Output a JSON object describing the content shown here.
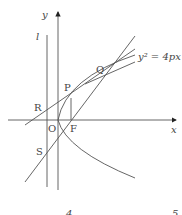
{
  "diagram": {
    "axes": {
      "x_label": "x",
      "y_label": "y",
      "origin_label": "O"
    },
    "directrix_label": "l",
    "points": {
      "P": "P",
      "Q": "Q",
      "R": "R",
      "S": "S",
      "F": "F"
    },
    "curve_label": "y² = 4px",
    "choice_numbers": [
      "4",
      "5"
    ]
  }
}
